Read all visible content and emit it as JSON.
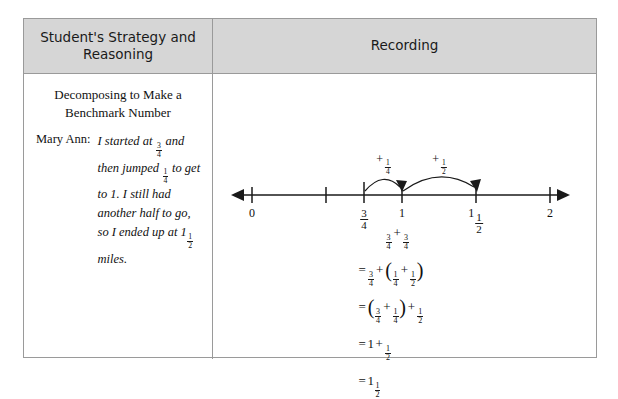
{
  "table": {
    "headers": {
      "left": "Student's Strategy and Reasoning",
      "right": "Recording"
    }
  },
  "strategy": {
    "title": "Decomposing to Make a Benchmark Number",
    "speaker": "Mary Ann:",
    "quote_parts": {
      "p1": "I started at ",
      "f1_num": "3",
      "f1_den": "4",
      "p2": " and then jumped ",
      "f2_num": "1",
      "f2_den": "4",
      "p3": " to get to 1. I still had another half to go, so I ended up at 1",
      "f3_num": "1",
      "f3_den": "2",
      "p4": " miles."
    }
  },
  "number_line": {
    "axis_start_label": "0",
    "ticks": [
      {
        "label_whole": "0",
        "label_num": "",
        "label_den": "",
        "x": 253
      },
      {
        "label_whole": "",
        "label_num": "",
        "label_den": "",
        "x": 327
      },
      {
        "label_whole": "",
        "label_num": "3",
        "label_den": "4",
        "x": 365
      },
      {
        "label_whole": "1",
        "label_num": "",
        "label_den": "",
        "x": 403
      },
      {
        "label_whole": "1",
        "label_num": "1",
        "label_den": "2",
        "x": 477
      },
      {
        "label_whole": "2",
        "label_num": "",
        "label_den": "",
        "x": 551
      }
    ],
    "jumps": [
      {
        "sign": "+",
        "num": "1",
        "den": "4",
        "from_x": 365,
        "to_x": 403,
        "label_x": 384
      },
      {
        "sign": "+",
        "num": "1",
        "den": "2",
        "from_x": 403,
        "to_x": 477,
        "label_x": 440
      }
    ]
  },
  "recording_equations": {
    "line1": {
      "lead": "",
      "a_num": "3",
      "a_den": "4",
      "op1": "+",
      "b_num": "3",
      "b_den": "4"
    },
    "line2": {
      "lead": "=",
      "a_num": "3",
      "a_den": "4",
      "op1": "+",
      "open": "(",
      "b_num": "1",
      "b_den": "4",
      "op2": "+",
      "c_num": "1",
      "c_den": "2",
      "close": ")"
    },
    "line3": {
      "lead": "=",
      "open": "(",
      "a_num": "3",
      "a_den": "4",
      "op1": "+",
      "b_num": "1",
      "b_den": "4",
      "close": ")",
      "op2": "+",
      "c_num": "1",
      "c_den": "2"
    },
    "line4": {
      "lead": "=",
      "whole": "1",
      "op1": "+",
      "a_num": "1",
      "a_den": "2"
    },
    "line5": {
      "lead": "=",
      "whole": "1",
      "a_num": "1",
      "a_den": "2"
    }
  },
  "colors": {
    "header_bg": "#d6d6d6",
    "border": "#9a9a9a",
    "ink": "#1a1a1a"
  }
}
